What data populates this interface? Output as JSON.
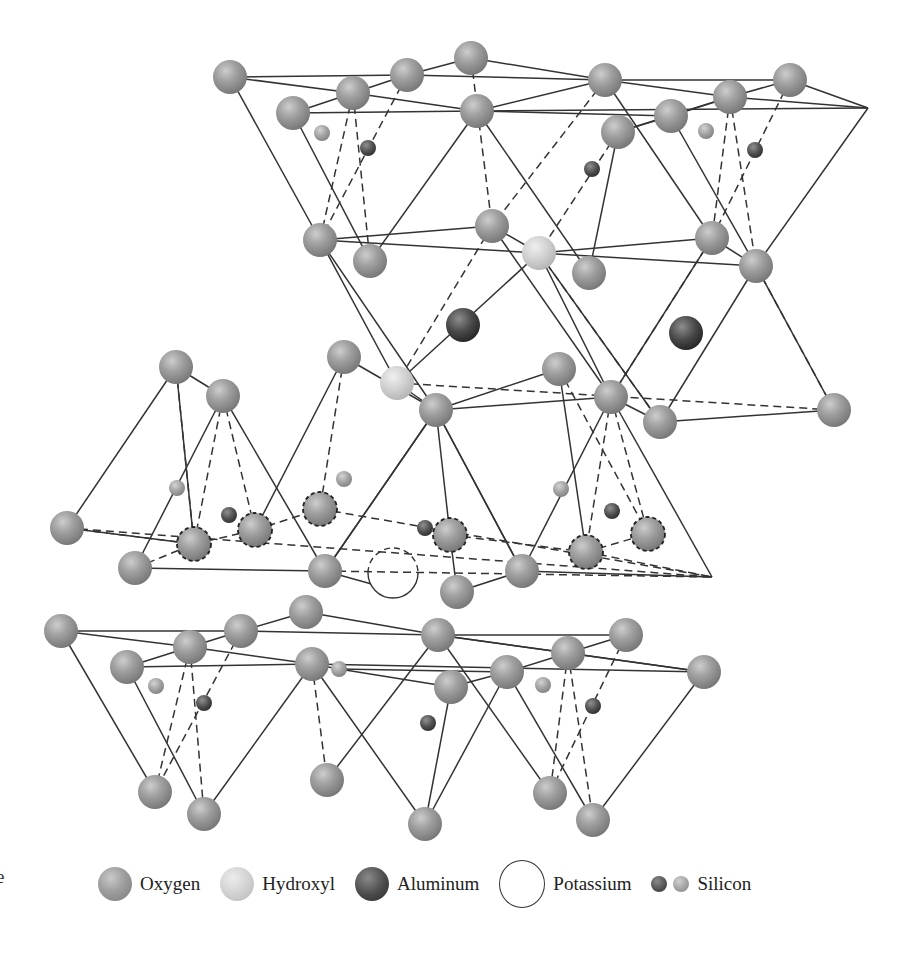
{
  "figure": {
    "edge_fragment": "e",
    "legend": [
      {
        "key": "oxygen",
        "label": "Oxygen",
        "icon": "oxygen-sphere-icon"
      },
      {
        "key": "hydroxyl",
        "label": "Hydroxyl",
        "icon": "hydroxyl-sphere-icon"
      },
      {
        "key": "aluminum",
        "label": "Aluminum",
        "icon": "aluminum-sphere-icon"
      },
      {
        "key": "potassium",
        "label": "Potassium",
        "icon": "potassium-circle-icon"
      },
      {
        "key": "silicon",
        "label": "Silicon",
        "icon": "silicon-sphere-icon"
      }
    ],
    "colors": {
      "oxygen": "#9d9d9d",
      "hydroxyl": "#d2d2d2",
      "aluminum": "#4a4a4a",
      "silicon_dark": "#505050",
      "silicon_light": "#a2a2a2",
      "bond": "#333333",
      "background": "#ffffff"
    }
  },
  "atoms": [
    {
      "id": "o1",
      "type": "oxygen",
      "x": 230,
      "y": 77,
      "r": 17
    },
    {
      "id": "o2",
      "type": "oxygen",
      "x": 353,
      "y": 93,
      "r": 17
    },
    {
      "id": "o3",
      "type": "oxygen",
      "x": 407,
      "y": 75,
      "r": 17
    },
    {
      "id": "o4",
      "type": "oxygen",
      "x": 471,
      "y": 58,
      "r": 17
    },
    {
      "id": "o5",
      "type": "oxygen",
      "x": 293,
      "y": 113,
      "r": 17
    },
    {
      "id": "o6",
      "type": "oxygen",
      "x": 477,
      "y": 111,
      "r": 17
    },
    {
      "id": "o7",
      "type": "oxygen",
      "x": 605,
      "y": 80,
      "r": 17
    },
    {
      "id": "o8",
      "type": "oxygen",
      "x": 730,
      "y": 97,
      "r": 17
    },
    {
      "id": "o9",
      "type": "oxygen",
      "x": 790,
      "y": 80,
      "r": 17
    },
    {
      "id": "o10",
      "type": "oxygen",
      "x": 671,
      "y": 116,
      "r": 17
    },
    {
      "id": "o11",
      "type": "oxygen",
      "x": 618,
      "y": 132,
      "r": 17
    },
    {
      "id": "si1",
      "type": "silicon_light",
      "x": 322,
      "y": 133,
      "r": 8
    },
    {
      "id": "si2",
      "type": "silicon_dark",
      "x": 368,
      "y": 148,
      "r": 8
    },
    {
      "id": "si3",
      "type": "silicon_dark",
      "x": 592,
      "y": 169,
      "r": 8
    },
    {
      "id": "si4",
      "type": "silicon_light",
      "x": 706,
      "y": 131,
      "r": 8
    },
    {
      "id": "si5",
      "type": "silicon_dark",
      "x": 755,
      "y": 150,
      "r": 8
    },
    {
      "id": "o12",
      "type": "oxygen",
      "x": 320,
      "y": 240,
      "r": 17
    },
    {
      "id": "o13",
      "type": "oxygen",
      "x": 370,
      "y": 261,
      "r": 17
    },
    {
      "id": "o14",
      "type": "oxygen",
      "x": 492,
      "y": 226,
      "r": 17
    },
    {
      "id": "h1",
      "type": "hydroxyl",
      "x": 539,
      "y": 253,
      "r": 17
    },
    {
      "id": "o15",
      "type": "oxygen",
      "x": 589,
      "y": 273,
      "r": 17
    },
    {
      "id": "o16",
      "type": "oxygen",
      "x": 712,
      "y": 238,
      "r": 17
    },
    {
      "id": "o17",
      "type": "oxygen",
      "x": 756,
      "y": 266,
      "r": 17
    },
    {
      "id": "al1",
      "type": "aluminum",
      "x": 463,
      "y": 325,
      "r": 17
    },
    {
      "id": "al2",
      "type": "aluminum",
      "x": 686,
      "y": 333,
      "r": 17
    },
    {
      "id": "o18",
      "type": "oxygen",
      "x": 176,
      "y": 367,
      "r": 17
    },
    {
      "id": "o19",
      "type": "oxygen",
      "x": 344,
      "y": 357,
      "r": 17
    },
    {
      "id": "o20",
      "type": "oxygen",
      "x": 223,
      "y": 396,
      "r": 17
    },
    {
      "id": "h2",
      "type": "hydroxyl",
      "x": 397,
      "y": 383,
      "r": 17
    },
    {
      "id": "o21",
      "type": "oxygen",
      "x": 559,
      "y": 369,
      "r": 17
    },
    {
      "id": "o22",
      "type": "oxygen",
      "x": 436,
      "y": 410,
      "r": 17
    },
    {
      "id": "o23",
      "type": "oxygen",
      "x": 611,
      "y": 397,
      "r": 17
    },
    {
      "id": "o24",
      "type": "oxygen",
      "x": 660,
      "y": 422,
      "r": 17
    },
    {
      "id": "o25",
      "type": "oxygen",
      "x": 834,
      "y": 410,
      "r": 17
    },
    {
      "id": "si6",
      "type": "silicon_light",
      "x": 177,
      "y": 488,
      "r": 8
    },
    {
      "id": "si7",
      "type": "silicon_light",
      "x": 344,
      "y": 479,
      "r": 8
    },
    {
      "id": "si8",
      "type": "silicon_dark",
      "x": 229,
      "y": 515,
      "r": 8
    },
    {
      "id": "si9",
      "type": "silicon_light",
      "x": 561,
      "y": 489,
      "r": 8
    },
    {
      "id": "si10",
      "type": "silicon_dark",
      "x": 612,
      "y": 511,
      "r": 8
    },
    {
      "id": "si11",
      "type": "silicon_dark",
      "x": 425,
      "y": 528,
      "r": 8
    },
    {
      "id": "o26",
      "type": "oxygen",
      "x": 67,
      "y": 528,
      "r": 17
    },
    {
      "id": "od1",
      "type": "oxygen_dashed",
      "x": 194,
      "y": 544,
      "r": 17
    },
    {
      "id": "od2",
      "type": "oxygen_dashed",
      "x": 255,
      "y": 530,
      "r": 17
    },
    {
      "id": "od3",
      "type": "oxygen_dashed",
      "x": 320,
      "y": 509,
      "r": 17
    },
    {
      "id": "od4",
      "type": "oxygen_dashed",
      "x": 450,
      "y": 535,
      "r": 17
    },
    {
      "id": "od5",
      "type": "oxygen_dashed",
      "x": 586,
      "y": 552,
      "r": 17
    },
    {
      "id": "od6",
      "type": "oxygen_dashed",
      "x": 648,
      "y": 534,
      "r": 17
    },
    {
      "id": "o27",
      "type": "oxygen",
      "x": 135,
      "y": 568,
      "r": 17
    },
    {
      "id": "o28",
      "type": "oxygen",
      "x": 325,
      "y": 571,
      "r": 17
    },
    {
      "id": "o29",
      "type": "oxygen",
      "x": 457,
      "y": 592,
      "r": 17
    },
    {
      "id": "o30",
      "type": "oxygen",
      "x": 522,
      "y": 571,
      "r": 17
    },
    {
      "id": "k1",
      "type": "potassium",
      "x": 393,
      "y": 573,
      "r": 25
    },
    {
      "id": "o31",
      "type": "oxygen",
      "x": 61,
      "y": 631,
      "r": 17
    },
    {
      "id": "o32",
      "type": "oxygen",
      "x": 190,
      "y": 647,
      "r": 17
    },
    {
      "id": "o33",
      "type": "oxygen",
      "x": 241,
      "y": 631,
      "r": 17
    },
    {
      "id": "o34",
      "type": "oxygen",
      "x": 306,
      "y": 612,
      "r": 17
    },
    {
      "id": "o35",
      "type": "oxygen",
      "x": 127,
      "y": 667,
      "r": 17
    },
    {
      "id": "o36",
      "type": "oxygen",
      "x": 312,
      "y": 664,
      "r": 17
    },
    {
      "id": "si12",
      "type": "silicon_light",
      "x": 339,
      "y": 669,
      "r": 8
    },
    {
      "id": "o37",
      "type": "oxygen",
      "x": 438,
      "y": 635,
      "r": 17
    },
    {
      "id": "o38",
      "type": "oxygen",
      "x": 568,
      "y": 653,
      "r": 17
    },
    {
      "id": "o39",
      "type": "oxygen",
      "x": 626,
      "y": 635,
      "r": 17
    },
    {
      "id": "o40",
      "type": "oxygen",
      "x": 507,
      "y": 672,
      "r": 17
    },
    {
      "id": "o41",
      "type": "oxygen",
      "x": 451,
      "y": 687,
      "r": 17
    },
    {
      "id": "o42",
      "type": "oxygen",
      "x": 704,
      "y": 672,
      "r": 17
    },
    {
      "id": "si13",
      "type": "silicon_light",
      "x": 156,
      "y": 686,
      "r": 8
    },
    {
      "id": "si14",
      "type": "silicon_dark",
      "x": 204,
      "y": 703,
      "r": 8
    },
    {
      "id": "si15",
      "type": "silicon_light",
      "x": 543,
      "y": 685,
      "r": 8
    },
    {
      "id": "si16",
      "type": "silicon_dark",
      "x": 593,
      "y": 706,
      "r": 8
    },
    {
      "id": "si17",
      "type": "silicon_dark",
      "x": 428,
      "y": 723,
      "r": 8
    },
    {
      "id": "o43",
      "type": "oxygen",
      "x": 155,
      "y": 792,
      "r": 17
    },
    {
      "id": "o44",
      "type": "oxygen",
      "x": 204,
      "y": 814,
      "r": 17
    },
    {
      "id": "o45",
      "type": "oxygen",
      "x": 327,
      "y": 780,
      "r": 17
    },
    {
      "id": "o46",
      "type": "oxygen",
      "x": 425,
      "y": 824,
      "r": 17
    },
    {
      "id": "o47",
      "type": "oxygen",
      "x": 550,
      "y": 793,
      "r": 17
    },
    {
      "id": "o48",
      "type": "oxygen",
      "x": 593,
      "y": 820,
      "r": 17
    }
  ],
  "bonds_solid": [
    [
      230,
      77,
      407,
      75
    ],
    [
      230,
      77,
      353,
      93
    ],
    [
      353,
      93,
      407,
      75
    ],
    [
      407,
      75,
      471,
      58
    ],
    [
      293,
      113,
      353,
      93
    ],
    [
      293,
      113,
      477,
      111
    ],
    [
      353,
      93,
      477,
      111
    ],
    [
      407,
      75,
      605,
      80
    ],
    [
      471,
      58,
      605,
      80
    ],
    [
      477,
      111,
      605,
      80
    ],
    [
      477,
      111,
      671,
      116
    ],
    [
      605,
      80,
      790,
      80
    ],
    [
      605,
      80,
      730,
      97
    ],
    [
      618,
      132,
      671,
      116
    ],
    [
      671,
      116,
      730,
      97
    ],
    [
      730,
      97,
      790,
      80
    ],
    [
      477,
      111,
      868,
      108
    ],
    [
      730,
      97,
      868,
      108
    ],
    [
      790,
      80,
      868,
      108
    ],
    [
      730,
      97,
      618,
      132
    ],
    [
      230,
      77,
      320,
      240
    ],
    [
      293,
      113,
      370,
      261
    ],
    [
      477,
      111,
      370,
      261
    ],
    [
      477,
      111,
      589,
      273
    ],
    [
      618,
      132,
      589,
      273
    ],
    [
      671,
      116,
      756,
      266
    ],
    [
      868,
      108,
      756,
      266
    ],
    [
      605,
      80,
      712,
      238
    ],
    [
      320,
      240,
      492,
      226
    ],
    [
      320,
      240,
      539,
      253
    ],
    [
      539,
      253,
      712,
      238
    ],
    [
      539,
      253,
      756,
      266
    ],
    [
      492,
      226,
      539,
      253
    ],
    [
      712,
      238,
      756,
      266
    ],
    [
      320,
      240,
      436,
      410
    ],
    [
      320,
      240,
      397,
      383
    ],
    [
      539,
      253,
      397,
      383
    ],
    [
      539,
      253,
      611,
      397
    ],
    [
      539,
      253,
      660,
      422
    ],
    [
      756,
      266,
      660,
      422
    ],
    [
      756,
      266,
      834,
      410
    ],
    [
      492,
      226,
      611,
      397
    ],
    [
      712,
      238,
      611,
      397
    ],
    [
      436,
      410,
      611,
      397
    ],
    [
      611,
      397,
      660,
      422
    ],
    [
      660,
      422,
      834,
      410
    ],
    [
      397,
      383,
      436,
      410
    ],
    [
      176,
      367,
      67,
      528
    ],
    [
      176,
      367,
      194,
      544
    ],
    [
      176,
      367,
      223,
      396
    ],
    [
      223,
      396,
      135,
      568
    ],
    [
      223,
      396,
      325,
      571
    ],
    [
      344,
      357,
      255,
      530
    ],
    [
      344,
      357,
      436,
      410
    ],
    [
      436,
      410,
      325,
      571
    ],
    [
      436,
      410,
      450,
      535
    ],
    [
      436,
      410,
      522,
      571
    ],
    [
      559,
      369,
      436,
      410
    ],
    [
      559,
      369,
      586,
      552
    ],
    [
      611,
      397,
      522,
      571
    ],
    [
      611,
      397,
      712,
      577
    ],
    [
      436,
      410,
      522,
      571
    ],
    [
      67,
      528,
      194,
      544
    ],
    [
      135,
      568,
      325,
      571
    ],
    [
      325,
      571,
      393,
      590
    ],
    [
      450,
      535,
      457,
      592
    ],
    [
      457,
      592,
      522,
      571
    ],
    [
      522,
      571,
      712,
      577
    ],
    [
      325,
      571,
      436,
      410
    ],
    [
      61,
      631,
      241,
      631
    ],
    [
      61,
      631,
      190,
      647
    ],
    [
      190,
      647,
      241,
      631
    ],
    [
      241,
      631,
      306,
      612
    ],
    [
      127,
      667,
      190,
      647
    ],
    [
      127,
      667,
      312,
      664
    ],
    [
      190,
      647,
      312,
      664
    ],
    [
      241,
      631,
      438,
      635
    ],
    [
      306,
      612,
      438,
      635
    ],
    [
      312,
      664,
      339,
      669
    ],
    [
      339,
      669,
      507,
      672
    ],
    [
      339,
      669,
      451,
      687
    ],
    [
      438,
      635,
      568,
      653
    ],
    [
      438,
      635,
      626,
      635
    ],
    [
      568,
      653,
      704,
      672
    ],
    [
      507,
      672,
      568,
      653
    ],
    [
      568,
      653,
      626,
      635
    ],
    [
      451,
      687,
      507,
      672
    ],
    [
      312,
      664,
      704,
      672
    ],
    [
      438,
      635,
      704,
      672
    ],
    [
      61,
      631,
      155,
      792
    ],
    [
      127,
      667,
      204,
      814
    ],
    [
      312,
      664,
      204,
      814
    ],
    [
      312,
      664,
      425,
      824
    ],
    [
      438,
      635,
      327,
      780
    ],
    [
      438,
      635,
      550,
      793
    ],
    [
      451,
      687,
      425,
      824
    ],
    [
      507,
      672,
      425,
      824
    ],
    [
      507,
      672,
      593,
      820
    ],
    [
      704,
      672,
      593,
      820
    ]
  ],
  "bonds_dashed": [
    [
      353,
      93,
      320,
      240
    ],
    [
      353,
      93,
      370,
      261
    ],
    [
      407,
      75,
      320,
      240
    ],
    [
      471,
      58,
      492,
      226
    ],
    [
      618,
      132,
      539,
      253
    ],
    [
      730,
      97,
      712,
      238
    ],
    [
      730,
      97,
      756,
      266
    ],
    [
      790,
      80,
      712,
      238
    ],
    [
      605,
      80,
      492,
      226
    ],
    [
      492,
      226,
      397,
      383
    ],
    [
      539,
      253,
      660,
      422
    ],
    [
      712,
      238,
      611,
      397
    ],
    [
      756,
      266,
      834,
      410
    ],
    [
      397,
      383,
      834,
      410
    ],
    [
      176,
      367,
      194,
      544
    ],
    [
      223,
      396,
      194,
      544
    ],
    [
      223,
      396,
      255,
      530
    ],
    [
      344,
      357,
      320,
      509
    ],
    [
      559,
      369,
      648,
      534
    ],
    [
      611,
      397,
      586,
      552
    ],
    [
      611,
      397,
      648,
      534
    ],
    [
      67,
      528,
      712,
      577
    ],
    [
      194,
      544,
      255,
      530
    ],
    [
      255,
      530,
      320,
      509
    ],
    [
      135,
      568,
      194,
      544
    ],
    [
      67,
      528,
      194,
      544
    ],
    [
      320,
      509,
      712,
      577
    ],
    [
      450,
      535,
      586,
      552
    ],
    [
      586,
      552,
      648,
      534
    ],
    [
      586,
      552,
      712,
      577
    ],
    [
      325,
      571,
      712,
      577
    ],
    [
      190,
      647,
      155,
      792
    ],
    [
      190,
      647,
      204,
      814
    ],
    [
      241,
      631,
      155,
      792
    ],
    [
      312,
      664,
      327,
      780
    ],
    [
      568,
      653,
      550,
      793
    ],
    [
      568,
      653,
      593,
      820
    ],
    [
      626,
      635,
      550,
      793
    ]
  ],
  "triangle_outlines": [
    [
      [
        868,
        108
      ],
      [
        756,
        266
      ]
    ],
    [
      [
        611,
        397
      ],
      [
        712,
        577
      ],
      [
        67,
        528
      ]
    ]
  ]
}
